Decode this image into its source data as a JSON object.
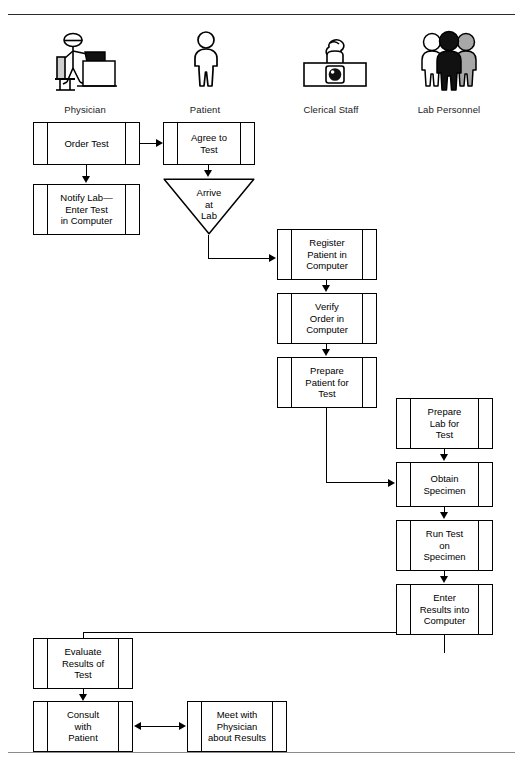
{
  "diagram": {
    "roles": [
      {
        "key": "physician",
        "label": "Physician",
        "icon": "physician-at-desk-icon",
        "x": 85,
        "y": 104
      },
      {
        "key": "patient",
        "label": "Patient",
        "icon": "standing-person-icon",
        "x": 205,
        "y": 104
      },
      {
        "key": "clerical",
        "label": "Clerical Staff",
        "icon": "clerk-at-counter-icon",
        "x": 331,
        "y": 104
      },
      {
        "key": "lab",
        "label": "Lab Personnel",
        "icon": "three-people-icon",
        "x": 449,
        "y": 104
      }
    ],
    "boxes": [
      {
        "id": "order_test",
        "role": "physician",
        "text": "Order Test",
        "x": 33,
        "y": 122,
        "w": 107,
        "h": 43
      },
      {
        "id": "notify_lab",
        "role": "physician",
        "text": "Notify Lab—\nEnter Test\nin Computer",
        "x": 33,
        "y": 184,
        "w": 107,
        "h": 51
      },
      {
        "id": "agree_to_test",
        "role": "patient",
        "text": "Agree to\nTest",
        "x": 163,
        "y": 122,
        "w": 92,
        "h": 43
      },
      {
        "id": "register_patient",
        "role": "clerical",
        "text": "Register\nPatient in\nComputer",
        "x": 277,
        "y": 229,
        "w": 100,
        "h": 51
      },
      {
        "id": "verify_order",
        "role": "clerical",
        "text": "Verify\nOrder in\nComputer",
        "x": 277,
        "y": 293,
        "w": 100,
        "h": 51
      },
      {
        "id": "prepare_patient",
        "role": "clerical",
        "text": "Prepare\nPatient for\nTest",
        "x": 277,
        "y": 357,
        "w": 100,
        "h": 51
      },
      {
        "id": "prepare_lab",
        "role": "lab",
        "text": "Prepare\nLab for\nTest",
        "x": 396,
        "y": 398,
        "w": 97,
        "h": 51
      },
      {
        "id": "obtain_specimen",
        "role": "lab",
        "text": "Obtain\nSpecimen",
        "x": 396,
        "y": 462,
        "w": 97,
        "h": 45
      },
      {
        "id": "run_test",
        "role": "lab",
        "text": "Run Test\non\nSpecimen",
        "x": 396,
        "y": 520,
        "w": 97,
        "h": 51
      },
      {
        "id": "enter_results",
        "role": "lab",
        "text": "Enter\nResults into\nComputer",
        "x": 396,
        "y": 584,
        "w": 97,
        "h": 51
      },
      {
        "id": "evaluate_results",
        "role": "physician",
        "text": "Evaluate\nResults of\nTest",
        "x": 33,
        "y": 638,
        "w": 100,
        "h": 51
      },
      {
        "id": "consult_patient",
        "role": "physician",
        "text": "Consult\nwith\nPatient",
        "x": 33,
        "y": 701,
        "w": 100,
        "h": 51
      },
      {
        "id": "meet_physician",
        "role": "patient",
        "text": "Meet with\nPhysician\nabout Results",
        "x": 187,
        "y": 701,
        "w": 100,
        "h": 51
      }
    ],
    "decisions": [
      {
        "id": "arrive_at_lab",
        "role": "patient",
        "text": "Arrive\nat\nLab",
        "x": 163,
        "y": 178,
        "w": 92,
        "h": 57
      }
    ],
    "connectors": [
      {
        "from": "order_test",
        "to": "agree_to_test",
        "style": "arrow-right"
      },
      {
        "from": "order_test",
        "to": "notify_lab",
        "style": "arrow-down"
      },
      {
        "from": "agree_to_test",
        "to": "arrive_at_lab",
        "style": "arrow-down"
      },
      {
        "from": "arrive_at_lab",
        "to": "register_patient",
        "style": "elbow-down-right"
      },
      {
        "from": "register_patient",
        "to": "verify_order",
        "style": "arrow-down"
      },
      {
        "from": "verify_order",
        "to": "prepare_patient",
        "style": "arrow-down"
      },
      {
        "from": "prepare_patient",
        "to": "obtain_specimen",
        "style": "elbow-down-right"
      },
      {
        "from": "prepare_lab",
        "to": "obtain_specimen",
        "style": "arrow-down"
      },
      {
        "from": "obtain_specimen",
        "to": "run_test",
        "style": "arrow-down"
      },
      {
        "from": "run_test",
        "to": "enter_results",
        "style": "arrow-down"
      },
      {
        "from": "enter_results",
        "to": "evaluate_results",
        "style": "elbow-down-left"
      },
      {
        "from": "evaluate_results",
        "to": "consult_patient",
        "style": "arrow-down"
      },
      {
        "from": "consult_patient",
        "to": "meet_physician",
        "style": "double-arrow-horizontal"
      }
    ]
  }
}
